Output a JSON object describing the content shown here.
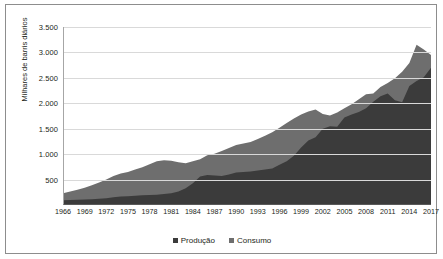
{
  "chart_data": {
    "type": "area",
    "title": "",
    "xlabel": "",
    "ylabel": "Milhares de barris diários",
    "ylim": [
      0,
      3500
    ],
    "xlim": [
      1966,
      2017
    ],
    "grid": true,
    "legend_position": "bottom-center",
    "ytick_labels": [
      "500",
      "1.000",
      "1.500",
      "2.000",
      "2.500",
      "3.000",
      "3.500"
    ],
    "ytick_values": [
      500,
      1000,
      1500,
      2000,
      2500,
      3000,
      3500
    ],
    "xtick_labels": [
      "1966",
      "1969",
      "1972",
      "1975",
      "1978",
      "1981",
      "1984",
      "1987",
      "1990",
      "1993",
      "1996",
      "1999",
      "2002",
      "2005",
      "2008",
      "2011",
      "2014",
      "2017"
    ],
    "x": [
      1966,
      1967,
      1968,
      1969,
      1970,
      1971,
      1972,
      1973,
      1974,
      1975,
      1976,
      1977,
      1978,
      1979,
      1980,
      1981,
      1982,
      1983,
      1984,
      1985,
      1986,
      1987,
      1988,
      1989,
      1990,
      1991,
      1992,
      1993,
      1994,
      1995,
      1996,
      1997,
      1998,
      1999,
      2000,
      2001,
      2002,
      2003,
      2004,
      2005,
      2006,
      2007,
      2008,
      2009,
      2010,
      2011,
      2012,
      2013,
      2014,
      2015,
      2016,
      2017
    ],
    "series": [
      {
        "name": "Consumo",
        "color": "#6e6e6e",
        "values": [
          230,
          265,
          300,
          340,
          390,
          440,
          500,
          570,
          620,
          650,
          700,
          740,
          800,
          860,
          880,
          870,
          840,
          820,
          860,
          900,
          980,
          1010,
          1060,
          1120,
          1180,
          1210,
          1240,
          1300,
          1360,
          1430,
          1520,
          1610,
          1700,
          1780,
          1840,
          1880,
          1790,
          1760,
          1820,
          1900,
          1980,
          2080,
          2180,
          2190,
          2320,
          2400,
          2490,
          2620,
          2790,
          3150,
          3060,
          2950
        ]
      },
      {
        "name": "Produção",
        "color": "#3b3b3b",
        "values": [
          95,
          100,
          105,
          110,
          115,
          125,
          135,
          150,
          165,
          170,
          180,
          190,
          195,
          200,
          215,
          230,
          265,
          330,
          430,
          560,
          590,
          580,
          570,
          600,
          640,
          650,
          660,
          680,
          700,
          720,
          790,
          860,
          970,
          1130,
          1270,
          1330,
          1500,
          1550,
          1540,
          1720,
          1780,
          1830,
          1900,
          2030,
          2140,
          2190,
          2060,
          2020,
          2340,
          2440,
          2510,
          2700
        ]
      }
    ]
  },
  "legend": [
    {
      "label": "Produção",
      "color": "#3b3b3b"
    },
    {
      "label": "Consumo",
      "color": "#6e6e6e"
    }
  ]
}
